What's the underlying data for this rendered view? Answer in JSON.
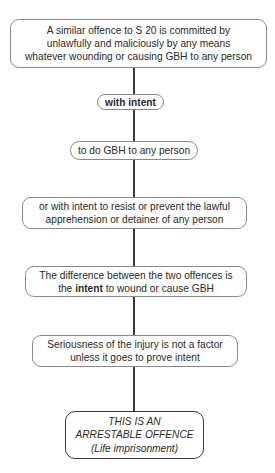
{
  "header": {
    "text": "OFFENCES AGAINST THE PERSON ACT 1861"
  },
  "diagram": {
    "nodes": [
      {
        "id": "n1",
        "lines": [
          "A similar offence to S 20 is committed by",
          "unlawfully and maliciously by any means",
          "whatever wounding or causing GBH to any person"
        ]
      },
      {
        "id": "n2",
        "lines": [
          "with intent"
        ]
      },
      {
        "id": "n3",
        "lines": [
          "to do GBH to any person"
        ]
      },
      {
        "id": "n4",
        "lines": [
          "or with intent to resist or prevent the lawful",
          "apprehension or detainer of any person"
        ]
      },
      {
        "id": "n5",
        "line1": "The difference between the two offences is",
        "line2_pre": "the ",
        "line2_bold": "intent",
        "line2_post": " to wound or cause GBH"
      },
      {
        "id": "n6",
        "lines": [
          "Seriousness of the injury is not a factor",
          "unless it goes to prove intent"
        ]
      },
      {
        "id": "n7",
        "lines": [
          "THIS IS AN",
          "ARRESTABLE OFFENCE",
          "(Life imprisonment)"
        ]
      }
    ],
    "edges": [
      [
        "n1",
        "n2"
      ],
      [
        "n2",
        "n3"
      ],
      [
        "n3",
        "n4"
      ],
      [
        "n4",
        "n5"
      ],
      [
        "n5",
        "n6"
      ],
      [
        "n6",
        "n7"
      ]
    ]
  }
}
